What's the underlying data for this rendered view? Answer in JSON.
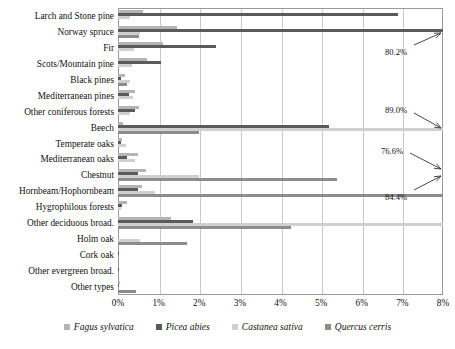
{
  "chart_data": {
    "type": "bar",
    "orientation": "horizontal",
    "grouped": true,
    "title": "",
    "subtitle": "",
    "xlabel": "",
    "ylabel": "",
    "xlim": [
      0,
      8
    ],
    "xunit": "%",
    "grid": true,
    "legend_position": "bottom",
    "xticks": [
      "0%",
      "1%",
      "2%",
      "3%",
      "4%",
      "5%",
      "6%",
      "7%",
      "8%"
    ],
    "xtick_values": [
      0,
      1,
      2,
      3,
      4,
      5,
      6,
      7,
      8
    ],
    "categories": [
      "Larch and Stone pine",
      "Norway spruce",
      "Fir",
      "Scots/Mountain pine",
      "Black pines",
      "Mediterranean pines",
      "Other coniferous forests",
      "Beech",
      "Temperate oaks",
      "Mediterranean oaks",
      "Chestnut",
      "Hornbeam/Hophornbeam",
      "Hygrophilous forests",
      "Other deciduous broad.",
      "Holm oak",
      "Cork oak",
      "Other evergreen broad.",
      "Other types"
    ],
    "series": [
      {
        "name": "Fagus sylvatica",
        "color": "#b4b4b4",
        "values": [
          0.62,
          1.45,
          1.1,
          0.72,
          0.18,
          0.42,
          0.52,
          0.12,
          0.1,
          0.48,
          0.7,
          0.58,
          0.22,
          1.3,
          0.0,
          0.0,
          0.0,
          0.05
        ]
      },
      {
        "name": "Picea abies",
        "color": "#5a5a5a",
        "values": [
          6.9,
          80.2,
          2.4,
          1.05,
          0.07,
          0.28,
          0.42,
          5.2,
          0.07,
          0.22,
          0.48,
          0.5,
          0.1,
          1.85,
          0.0,
          0.02,
          0.02,
          0.03
        ]
      },
      {
        "name": "Castanea sativa",
        "color": "#d0d0d0",
        "values": [
          0.3,
          0.55,
          0.4,
          0.35,
          0.3,
          0.38,
          0.3,
          89.0,
          0.2,
          0.42,
          2.0,
          0.9,
          0.08,
          76.6,
          0.55,
          0.0,
          0.0,
          0.0
        ]
      },
      {
        "name": "Quercus cerris",
        "color": "#8c8c8c",
        "values": [
          0.0,
          0.52,
          0.0,
          0.0,
          0.22,
          0.0,
          0.0,
          2.0,
          0.0,
          0.0,
          5.4,
          84.4,
          0.0,
          4.25,
          1.7,
          0.0,
          0.0,
          0.45
        ]
      }
    ],
    "annotations": [
      {
        "text": "80.2%",
        "category": "Norway spruce",
        "series": "Picea abies",
        "value": 80.2
      },
      {
        "text": "89.0%",
        "category": "Beech",
        "series": "Castanea sativa",
        "value": 89.0
      },
      {
        "text": "76.6%",
        "category": "Chestnut",
        "series": "Castanea sativa",
        "value": 76.6
      },
      {
        "text": "84.4%",
        "category": "Hornbeam/Hophornbeam",
        "series": "Quercus cerris",
        "value": 84.4
      }
    ]
  },
  "legend": {
    "items": [
      {
        "label": "Fagus sylvatica",
        "color": "#b4b4b4"
      },
      {
        "label": "Picea abies",
        "color": "#5a5a5a"
      },
      {
        "label": "Castanea sativa",
        "color": "#d0d0d0"
      },
      {
        "label": "Quercus cerris",
        "color": "#8c8c8c"
      }
    ]
  }
}
